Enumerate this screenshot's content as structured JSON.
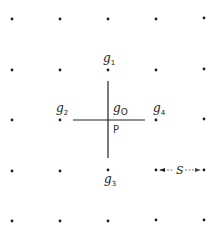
{
  "diagram": {
    "grid": {
      "columns_x": [
        12,
        60,
        108,
        156,
        204
      ],
      "rows_y": [
        19,
        70,
        120,
        171,
        221
      ],
      "dot_color": "#222222"
    },
    "cross": {
      "center_x": 108,
      "center_y": 120,
      "horizontal": [
        73,
        145
      ],
      "vertical": [
        81,
        158
      ],
      "color": "#222222"
    },
    "labels": {
      "g1": {
        "base": "g",
        "sub": "1"
      },
      "g2": {
        "base": "g",
        "sub": "2"
      },
      "g3": {
        "base": "g",
        "sub": "3"
      },
      "g4": {
        "base": "g",
        "sub": "4"
      },
      "g0": {
        "base": "g",
        "sub": "O"
      },
      "p": "P",
      "s": "S"
    }
  }
}
